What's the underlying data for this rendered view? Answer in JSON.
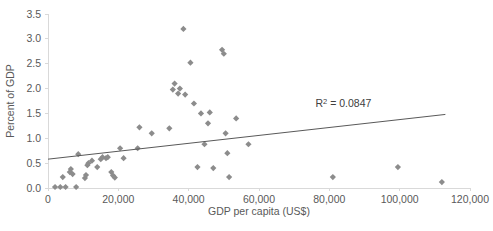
{
  "chart_data": {
    "type": "scatter",
    "title": "",
    "xlabel": "GDP per capita (US$)",
    "ylabel": "Percent of GDP",
    "xlim": [
      0,
      120000
    ],
    "ylim": [
      0.0,
      3.5
    ],
    "xticks": [
      "0",
      "20,000",
      "40,000",
      "60,000",
      "80,000",
      "100,000",
      "120,000"
    ],
    "xtick_values": [
      0,
      20000,
      40000,
      60000,
      80000,
      100000,
      120000
    ],
    "yticks": [
      "0.0",
      "0.5",
      "1.0",
      "1.5",
      "2.0",
      "2.5",
      "3.0",
      "3.5"
    ],
    "ytick_values": [
      0.0,
      0.5,
      1.0,
      1.5,
      2.0,
      2.5,
      3.0,
      3.5
    ],
    "grid": false,
    "legend": "none",
    "marker_shape": "diamond",
    "marker_color": "#8c8c8c",
    "trendline_color": "#595959",
    "annotations": [
      {
        "text": "R2 = 0.0847",
        "prefix": "R",
        "superscript": "2",
        "suffix": " = 0.0847",
        "x": 84000,
        "y": 1.62
      }
    ],
    "trendline": {
      "x_start": 0,
      "y_start": 0.58,
      "x_end": 113000,
      "y_end": 1.48
    },
    "points": [
      {
        "x": 2000,
        "y": 0.02
      },
      {
        "x": 3500,
        "y": 0.02
      },
      {
        "x": 4200,
        "y": 0.22
      },
      {
        "x": 5000,
        "y": 0.02
      },
      {
        "x": 6200,
        "y": 0.32
      },
      {
        "x": 6500,
        "y": 0.38
      },
      {
        "x": 7000,
        "y": 0.28
      },
      {
        "x": 8000,
        "y": 0.02
      },
      {
        "x": 8600,
        "y": 0.68
      },
      {
        "x": 10500,
        "y": 0.2
      },
      {
        "x": 10800,
        "y": 0.26
      },
      {
        "x": 11200,
        "y": 0.46
      },
      {
        "x": 11500,
        "y": 0.5
      },
      {
        "x": 12500,
        "y": 0.55
      },
      {
        "x": 14000,
        "y": 0.42
      },
      {
        "x": 15000,
        "y": 0.58
      },
      {
        "x": 15500,
        "y": 0.62
      },
      {
        "x": 16500,
        "y": 0.6
      },
      {
        "x": 17000,
        "y": 0.62
      },
      {
        "x": 18000,
        "y": 0.32
      },
      {
        "x": 18500,
        "y": 0.25
      },
      {
        "x": 19000,
        "y": 0.21
      },
      {
        "x": 20500,
        "y": 0.8
      },
      {
        "x": 21500,
        "y": 0.6
      },
      {
        "x": 25500,
        "y": 0.8
      },
      {
        "x": 26000,
        "y": 1.22
      },
      {
        "x": 29500,
        "y": 1.1
      },
      {
        "x": 34500,
        "y": 1.2
      },
      {
        "x": 35500,
        "y": 1.98
      },
      {
        "x": 36000,
        "y": 2.1
      },
      {
        "x": 37000,
        "y": 1.9
      },
      {
        "x": 37500,
        "y": 2.0
      },
      {
        "x": 38500,
        "y": 3.2
      },
      {
        "x": 39000,
        "y": 1.88
      },
      {
        "x": 40500,
        "y": 2.52
      },
      {
        "x": 41500,
        "y": 1.7
      },
      {
        "x": 42500,
        "y": 0.42
      },
      {
        "x": 43500,
        "y": 1.5
      },
      {
        "x": 44500,
        "y": 0.88
      },
      {
        "x": 45500,
        "y": 1.3
      },
      {
        "x": 46000,
        "y": 1.52
      },
      {
        "x": 47000,
        "y": 0.4
      },
      {
        "x": 49500,
        "y": 2.78
      },
      {
        "x": 50000,
        "y": 2.7
      },
      {
        "x": 50500,
        "y": 1.1
      },
      {
        "x": 51000,
        "y": 0.7
      },
      {
        "x": 51500,
        "y": 0.22
      },
      {
        "x": 53500,
        "y": 1.4
      },
      {
        "x": 57000,
        "y": 0.88
      },
      {
        "x": 81000,
        "y": 0.22
      },
      {
        "x": 99500,
        "y": 0.42
      },
      {
        "x": 112000,
        "y": 0.12
      }
    ]
  }
}
